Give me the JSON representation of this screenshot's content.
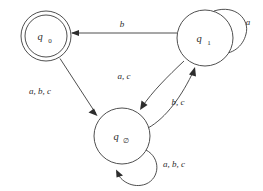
{
  "diagram": {
    "type": "finite-state-automaton",
    "title": "",
    "background_color": "#ffffff",
    "stroke_color": "#3b3b3b",
    "text_color": "#2d2d2d",
    "alphabet": [
      "a",
      "b",
      "c"
    ],
    "states": [
      {
        "id": "q0",
        "base": "q",
        "subscript": "0",
        "accepting": true,
        "cx": 46,
        "cy": 36,
        "r": 25,
        "inner_r": 21
      },
      {
        "id": "q1",
        "base": "q",
        "subscript": "1",
        "accepting": false,
        "cx": 205,
        "cy": 38,
        "r": 28,
        "inner_r": 0
      },
      {
        "id": "qempty",
        "base": "q",
        "subscript": "∅",
        "accepting": false,
        "cx": 122,
        "cy": 136,
        "r": 28,
        "inner_r": 0
      }
    ],
    "transitions": [
      {
        "id": "t-q1-q0",
        "from": "q1",
        "to": "q0",
        "label": "b",
        "label_x": 122,
        "label_y": 27
      },
      {
        "id": "t-q0-qempty",
        "from": "q0",
        "to": "qempty",
        "label": "a, b, c",
        "label_x": 40,
        "label_y": 94
      },
      {
        "id": "t-q1-qempty",
        "from": "q1",
        "to": "qempty",
        "label": "a, c",
        "label_x": 124,
        "label_y": 79
      },
      {
        "id": "t-qempty-q1",
        "from": "qempty",
        "to": "q1",
        "label": "b, c",
        "label_x": 178,
        "label_y": 105
      },
      {
        "id": "t-q1-q1-loop",
        "from": "q1",
        "to": "q1",
        "label": "a",
        "label_x": 248,
        "label_y": 25
      },
      {
        "id": "t-qempty-qempty-loop",
        "from": "qempty",
        "to": "qempty",
        "label": "a, b, c",
        "label_x": 163,
        "label_y": 167
      }
    ]
  }
}
